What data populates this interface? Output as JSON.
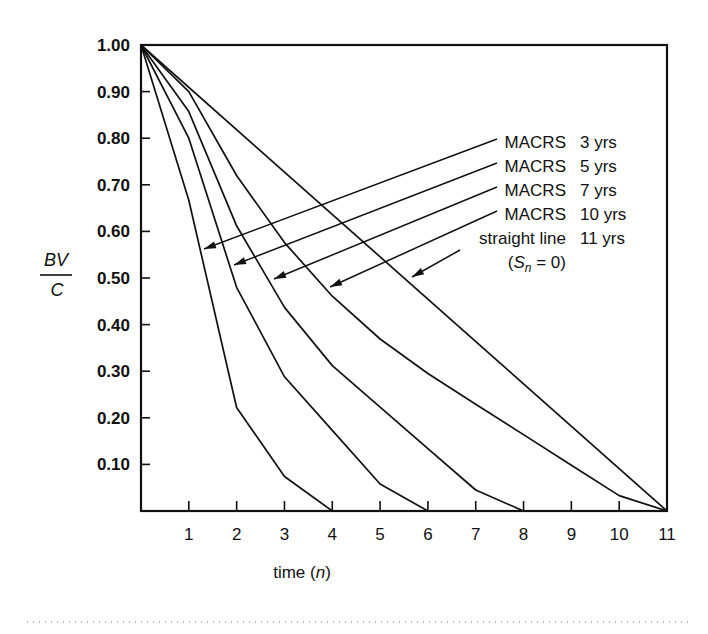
{
  "chart_data": {
    "type": "line",
    "title": "",
    "xlabel": "time (n)",
    "xlabel_parts": {
      "prefix": "time (",
      "var": "n",
      "suffix": ")"
    },
    "ylabel": "BV/C",
    "ylabel_parts": {
      "numerator": "BV",
      "denominator": "C"
    },
    "xlim": [
      0,
      11
    ],
    "ylim": [
      0,
      1.0
    ],
    "grid": false,
    "x_ticks": [
      1,
      2,
      3,
      4,
      5,
      6,
      7,
      8,
      9,
      10,
      11
    ],
    "y_ticks": [
      "0.10",
      "0.20",
      "0.30",
      "0.40",
      "0.50",
      "0.60",
      "0.70",
      "0.80",
      "0.90",
      "1.00"
    ],
    "y_tick_values": [
      0.1,
      0.2,
      0.3,
      0.4,
      0.5,
      0.6,
      0.7,
      0.8,
      0.9,
      1.0
    ],
    "legend_position": "inside-right, with arrows pointing to curves",
    "series": [
      {
        "name": "MACRS 3 yrs",
        "label": "MACRS",
        "period": "3 yrs",
        "x": [
          0,
          1,
          2,
          3,
          4
        ],
        "values": [
          1.0,
          0.667,
          0.222,
          0.074,
          0.0
        ]
      },
      {
        "name": "MACRS 5 yrs",
        "label": "MACRS",
        "period": "5 yrs",
        "x": [
          0,
          1,
          2,
          3,
          4,
          5,
          6
        ],
        "values": [
          1.0,
          0.8,
          0.48,
          0.288,
          0.173,
          0.058,
          0.0
        ]
      },
      {
        "name": "MACRS 7 yrs",
        "label": "MACRS",
        "period": "7 yrs",
        "x": [
          0,
          1,
          2,
          3,
          4,
          5,
          6,
          7,
          8
        ],
        "values": [
          1.0,
          0.857,
          0.612,
          0.437,
          0.312,
          0.223,
          0.134,
          0.045,
          0.0
        ]
      },
      {
        "name": "MACRS 10 yrs",
        "label": "MACRS",
        "period": "10 yrs",
        "x": [
          0,
          1,
          2,
          3,
          4,
          5,
          6,
          7,
          8,
          9,
          10,
          11
        ],
        "values": [
          1.0,
          0.9,
          0.72,
          0.576,
          0.461,
          0.369,
          0.295,
          0.229,
          0.164,
          0.098,
          0.033,
          0.0
        ]
      },
      {
        "name": "straight line 11 yrs",
        "label": "straight line",
        "period": "11 yrs",
        "note": "(Sn = 0)",
        "x": [
          0,
          11
        ],
        "values": [
          1.0,
          0.0
        ]
      }
    ],
    "annotations": [
      {
        "text": "MACRS 3 yrs",
        "arrow_to_series": 0
      },
      {
        "text": "MACRS 5 yrs",
        "arrow_to_series": 1
      },
      {
        "text": "MACRS 7 yrs",
        "arrow_to_series": 2
      },
      {
        "text": "MACRS 10 yrs",
        "arrow_to_series": 3
      },
      {
        "text": "straight line 11 yrs (Sn = 0)",
        "arrow_to_series": 4
      }
    ]
  },
  "legend": {
    "items": [
      {
        "label": "MACRS",
        "period": "3 yrs"
      },
      {
        "label": "MACRS",
        "period": "5 yrs"
      },
      {
        "label": "MACRS",
        "period": "7 yrs"
      },
      {
        "label": "MACRS",
        "period": "10 yrs"
      },
      {
        "label": "straight line",
        "period": "11 yrs"
      }
    ],
    "note_prefix": "(",
    "note_var": "S",
    "note_sub": "n",
    "note_suffix": " = 0)"
  },
  "colors": {
    "line": "#111111",
    "background": "#ffffff",
    "dotted_rule": "#777777"
  }
}
